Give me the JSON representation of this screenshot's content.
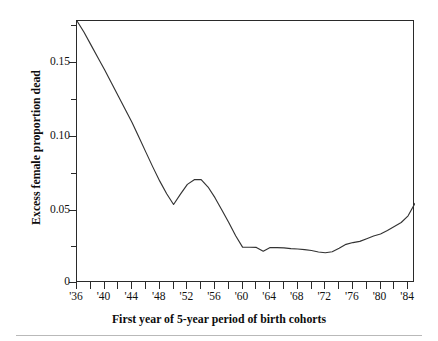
{
  "chart_data": {
    "type": "line",
    "title": "",
    "xlabel": "First year of 5-year period of birth cohorts",
    "ylabel": "Excess female proportion dead",
    "xlim": [
      1936,
      1985
    ],
    "ylim": [
      0,
      0.1775
    ],
    "grid": false,
    "legend": "none",
    "x_tick_labels": [
      "'36",
      "'40",
      "'44",
      "'48",
      "'52",
      "'56",
      "'60",
      "'64",
      "'68",
      "'72",
      "'76",
      "'80",
      "'84"
    ],
    "x_tick_values": [
      1936,
      1940,
      1944,
      1948,
      1952,
      1956,
      1960,
      1964,
      1968,
      1972,
      1976,
      1980,
      1984
    ],
    "x_minor_tick_values": [
      1938,
      1942,
      1946,
      1950,
      1954,
      1958,
      1962,
      1966,
      1970,
      1974,
      1978,
      1982
    ],
    "y_tick_labels": [
      "0",
      "0.05",
      "0.10",
      "0.15"
    ],
    "y_tick_values": [
      0,
      0.05,
      0.1,
      0.15
    ],
    "y_minor_tick_values": [
      0.025,
      0.075,
      0.125,
      0.175
    ],
    "series": [
      {
        "name": "Excess female proportion dead",
        "color": "#333333",
        "x": [
          1936,
          1937,
          1938,
          1939,
          1940,
          1941,
          1942,
          1943,
          1944,
          1945,
          1946,
          1947,
          1948,
          1949,
          1950,
          1951,
          1952,
          1953,
          1954,
          1955,
          1956,
          1957,
          1958,
          1959,
          1960,
          1961,
          1962,
          1963,
          1964,
          1965,
          1966,
          1967,
          1968,
          1969,
          1970,
          1971,
          1972,
          1973,
          1974,
          1975,
          1976,
          1977,
          1978,
          1979,
          1980,
          1981,
          1982,
          1983,
          1984,
          1985
        ],
        "y": [
          0.1775,
          0.17,
          0.1615,
          0.153,
          0.1445,
          0.1355,
          0.1265,
          0.1175,
          0.1085,
          0.0985,
          0.0885,
          0.0785,
          0.069,
          0.0605,
          0.0532,
          0.0602,
          0.0668,
          0.07,
          0.07,
          0.065,
          0.0578,
          0.0495,
          0.041,
          0.032,
          0.0243,
          0.0242,
          0.0241,
          0.0215,
          0.024,
          0.024,
          0.0238,
          0.0233,
          0.023,
          0.0226,
          0.022,
          0.021,
          0.0205,
          0.0212,
          0.0235,
          0.0262,
          0.0274,
          0.0282,
          0.03,
          0.0318,
          0.0332,
          0.0355,
          0.0382,
          0.041,
          0.0455,
          0.054
        ]
      }
    ]
  },
  "axes": {
    "y_title": "Excess female proportion dead",
    "x_title": "First year of 5-year period of birth cohorts"
  }
}
